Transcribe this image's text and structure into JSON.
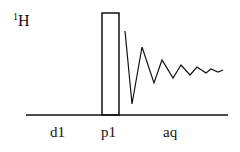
{
  "diagram": {
    "nucleus": {
      "mass": "1",
      "symbol": "H"
    },
    "periods": [
      {
        "label": "d1",
        "x": 59
      },
      {
        "label": "p1",
        "x": 110
      },
      {
        "label": "aq",
        "x": 172
      }
    ],
    "baseline": {
      "x1": 26,
      "x2": 228,
      "y": 115
    },
    "pulse": {
      "x": 102,
      "y": 13,
      "width": 17,
      "height": 102
    },
    "fid_points": [
      [
        125,
        31
      ],
      [
        132,
        104
      ],
      [
        142,
        47
      ],
      [
        154,
        83
      ],
      [
        162,
        60
      ],
      [
        173,
        78
      ],
      [
        181,
        65
      ],
      [
        190,
        75
      ],
      [
        197,
        67
      ],
      [
        206,
        73
      ],
      [
        211,
        69
      ],
      [
        218,
        72
      ],
      [
        223,
        70
      ]
    ],
    "stroke_color": "#111111"
  }
}
